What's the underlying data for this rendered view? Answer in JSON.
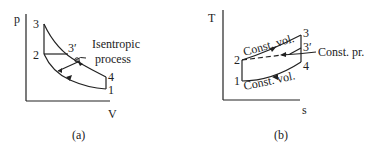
{
  "figure_a": {
    "axis_y": "p",
    "axis_x": "V",
    "caption": "(a)",
    "points": {
      "p1": "1",
      "p2": "2",
      "p3": "3",
      "p3p": "3′",
      "p4": "4"
    },
    "annotation_line1": "Isentropic",
    "annotation_line2": "process"
  },
  "figure_b": {
    "axis_y": "T",
    "axis_x": "s",
    "caption": "(b)",
    "points": {
      "p1": "1",
      "p2": "2",
      "p3": "3",
      "p3p": "3′",
      "p4": "4"
    },
    "label_top": "Const. vol.",
    "label_bottom": "Const. vol.",
    "label_right": "Const. pr."
  },
  "colors": {
    "ink": "#222222",
    "background": "#ffffff"
  }
}
